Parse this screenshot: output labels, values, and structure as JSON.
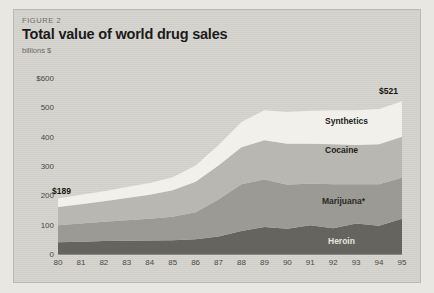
{
  "figure": {
    "kicker": "FIGURE 2",
    "title": "Total value of world drug sales",
    "units": "billions $"
  },
  "callouts": {
    "start_value": "$189",
    "end_value": "$521"
  },
  "series_labels": {
    "synthetics": "Synthetics",
    "cocaine": "Cocaine",
    "marijuana": "Marijuana*",
    "heroin": "Heroin"
  },
  "colors": {
    "panel": "#d3d1cc",
    "synthetics": "#f2f0ea",
    "cocaine": "#b9b7b1",
    "marijuana": "#9c9a94",
    "heroin": "#66645f",
    "axis": "#8b8984"
  },
  "chart_data": {
    "type": "area",
    "stacked": true,
    "title": "Total value of world drug sales",
    "xlabel": "",
    "ylabel": "billions $",
    "ylim": [
      0,
      600
    ],
    "yticks": [
      "0",
      "100",
      "200",
      "300",
      "400",
      "500",
      "$600"
    ],
    "ytick_values": [
      0,
      100,
      200,
      300,
      400,
      500,
      600
    ],
    "grid": false,
    "legend": "inline-band-labels",
    "categories": [
      "80",
      "81",
      "82",
      "83",
      "84",
      "85",
      "86",
      "87",
      "88",
      "89",
      "90",
      "91",
      "92",
      "93",
      "94",
      "95"
    ],
    "series": [
      {
        "name": "Heroin",
        "values": [
          40,
          42,
          44,
          45,
          46,
          47,
          50,
          60,
          78,
          92,
          86,
          98,
          88,
          104,
          96,
          120
        ]
      },
      {
        "name": "Marijuana*",
        "values": [
          58,
          62,
          66,
          70,
          74,
          80,
          92,
          126,
          160,
          162,
          150,
          142,
          150,
          134,
          142,
          140
        ]
      },
      {
        "name": "Cocaine",
        "values": [
          62,
          66,
          70,
          76,
          82,
          90,
          104,
          116,
          126,
          134,
          140,
          136,
          136,
          134,
          136,
          140
        ]
      },
      {
        "name": "Synthetics",
        "values": [
          29,
          32,
          34,
          37,
          40,
          45,
          56,
          70,
          86,
          102,
          108,
          112,
          116,
          118,
          120,
          121
        ]
      }
    ],
    "totals": [
      189,
      202,
      214,
      228,
      242,
      262,
      302,
      372,
      450,
      490,
      484,
      488,
      490,
      490,
      494,
      521
    ],
    "annotations": [
      {
        "text": "$189",
        "x": "80",
        "y": 189
      },
      {
        "text": "$521",
        "x": "95",
        "y": 521
      }
    ],
    "footnote_marker": "*"
  }
}
